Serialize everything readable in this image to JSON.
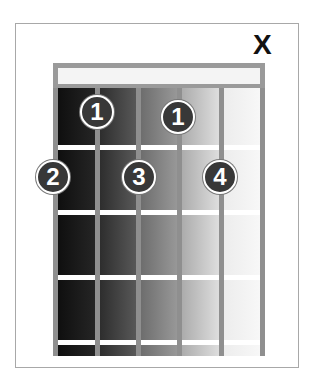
{
  "diagram": {
    "type": "guitar-chord-chart",
    "strings": 6,
    "frets_shown": 4,
    "muted_marker": "X",
    "muted_string": 6,
    "fingers": [
      {
        "label": "1",
        "string": 2,
        "fret": 1
      },
      {
        "label": "1",
        "string": 4,
        "fret": 1
      },
      {
        "label": "2",
        "string": 1,
        "fret": 2
      },
      {
        "label": "3",
        "string": 3,
        "fret": 2
      },
      {
        "label": "4",
        "string": 5,
        "fret": 2
      }
    ],
    "colors": {
      "dot_fill": "#383838",
      "dot_text": "#ffffff",
      "string": "#8f8f8f",
      "fret": "#ffffff",
      "nut": "#9a9a9a"
    }
  }
}
